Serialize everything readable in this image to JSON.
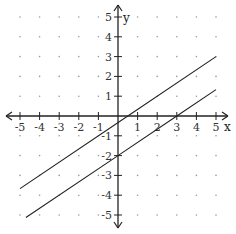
{
  "chart_data": {
    "type": "line",
    "title": "",
    "xlabel": "x",
    "ylabel": "y",
    "xlim": [
      -5,
      5
    ],
    "ylim": [
      -5,
      5
    ],
    "grid": "dots",
    "x_ticks": [
      "-5",
      "-4",
      "-3",
      "-2",
      "-1",
      "1",
      "2",
      "3",
      "4",
      "5"
    ],
    "y_ticks": [
      "5",
      "4",
      "3",
      "2",
      "1",
      "-1",
      "-2",
      "-3",
      "-4",
      "-5"
    ],
    "series": [
      {
        "name": "upper line",
        "equation": "y = (2/3)x - 1/3",
        "points": [
          [
            -5,
            -3.67
          ],
          [
            0.5,
            0
          ],
          [
            5,
            3.0
          ]
        ]
      },
      {
        "name": "lower line",
        "equation": "y = (2/3)x - 2",
        "points": [
          [
            -4.7,
            -5.13
          ],
          [
            0,
            -2
          ],
          [
            3,
            0
          ],
          [
            5,
            1.33
          ]
        ]
      }
    ]
  }
}
